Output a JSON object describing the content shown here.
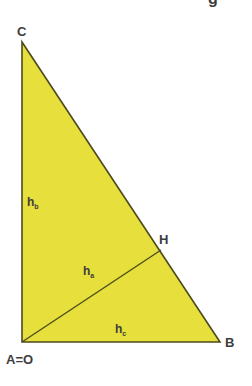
{
  "diagram": {
    "type": "right-triangle-altitudes",
    "fill_color": "#e6df3c",
    "stroke_color": "#4d4a1e",
    "label_color": "#3d3d3d",
    "top_fragment": "g",
    "vertices": {
      "C": {
        "label": "C",
        "x": 22,
        "y": 42
      },
      "A": {
        "label": "A=O",
        "x": 22,
        "y": 342
      },
      "B": {
        "label": "B",
        "x": 220,
        "y": 342
      },
      "H": {
        "label": "H",
        "x": 161,
        "y": 250
      }
    },
    "altitudes": {
      "hb": {
        "main": "h",
        "sub": "b"
      },
      "ha": {
        "main": "h",
        "sub": "a"
      },
      "hc": {
        "main": "h",
        "sub": "c"
      }
    }
  }
}
